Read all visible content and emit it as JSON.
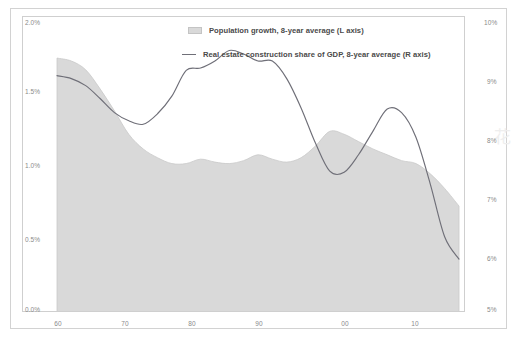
{
  "chart_data": {
    "type": "area",
    "title": "",
    "subtitle": "",
    "xlabel": "",
    "ylabel": "",
    "grid": false,
    "legend_position": "top-center",
    "x_ticks": [
      "60",
      "70",
      "80",
      "90",
      "00",
      "10"
    ],
    "x_tick_years": [
      1960,
      1970,
      1980,
      1990,
      2000,
      2010
    ],
    "xlim": [
      1960,
      2016
    ],
    "left_axis": {
      "label": "Population growth, 8-year average",
      "ticks": [
        "0.0%",
        "0.5%",
        "1.0%",
        "1.5%",
        "2.0%"
      ],
      "ylim": [
        0.0,
        2.0
      ],
      "unit": "%"
    },
    "right_axis": {
      "label": "Real estate construction share of GDP, 8-year average",
      "ticks": [
        "5%",
        "6%",
        "7%",
        "8%",
        "9%",
        "10%"
      ],
      "ylim": [
        5,
        10
      ],
      "unit": "%"
    },
    "series": [
      {
        "name": "Population growth, 8-year average (L axis)",
        "type": "area",
        "axis": "left",
        "color": "#d9d9d9",
        "x": [
          1960,
          1962,
          1964,
          1966,
          1968,
          1970,
          1972,
          1974,
          1976,
          1978,
          1980,
          1982,
          1984,
          1986,
          1988,
          1990,
          1992,
          1994,
          1996,
          1998,
          2000,
          2002,
          2004,
          2006,
          2008,
          2010,
          2012,
          2014,
          2016
        ],
        "values": [
          1.74,
          1.72,
          1.66,
          1.53,
          1.38,
          1.22,
          1.12,
          1.06,
          1.02,
          1.02,
          1.05,
          1.03,
          1.02,
          1.04,
          1.08,
          1.05,
          1.03,
          1.06,
          1.14,
          1.24,
          1.22,
          1.17,
          1.12,
          1.08,
          1.04,
          1.02,
          0.95,
          0.85,
          0.73
        ]
      },
      {
        "name": "Real estate construction share of GDP, 8-year average (R axis)",
        "type": "line",
        "axis": "right",
        "color": "#6f6f78",
        "x": [
          1960,
          1962,
          1964,
          1966,
          1968,
          1970,
          1972,
          1974,
          1976,
          1978,
          1980,
          1982,
          1984,
          1986,
          1988,
          1990,
          1992,
          1994,
          1996,
          1998,
          2000,
          2002,
          2004,
          2006,
          2008,
          2010,
          2012,
          2014,
          2016
        ],
        "values": [
          9.05,
          9.0,
          8.88,
          8.66,
          8.42,
          8.28,
          8.22,
          8.4,
          8.7,
          9.14,
          9.18,
          9.3,
          9.48,
          9.42,
          9.3,
          9.3,
          9.0,
          8.5,
          7.9,
          7.42,
          7.4,
          7.7,
          8.1,
          8.48,
          8.42,
          8.0,
          7.2,
          6.3,
          5.92
        ]
      }
    ]
  },
  "legend": [
    {
      "marker": "area-swatch",
      "label": "Population growth, 8-year average (L axis)"
    },
    {
      "marker": "line-swatch",
      "label": "Real estate construction share of GDP, 8-year average (R axis)"
    }
  ],
  "axes": {
    "left_ticks": [
      {
        "value": 2.0,
        "label": "2.0%"
      },
      {
        "value": 1.5,
        "label": "1.5%"
      },
      {
        "value": 1.0,
        "label": "1.0%"
      },
      {
        "value": 0.5,
        "label": "0.5%"
      },
      {
        "value": 0.0,
        "label": "0.0%"
      }
    ],
    "right_ticks": [
      {
        "value": 10,
        "label": "10%"
      },
      {
        "value": 9,
        "label": "9%"
      },
      {
        "value": 8,
        "label": "8%"
      },
      {
        "value": 7,
        "label": "7%"
      },
      {
        "value": 6,
        "label": "6%"
      },
      {
        "value": 5,
        "label": "5%"
      }
    ],
    "x_ticks": [
      {
        "value": 1960,
        "label": "60"
      },
      {
        "value": 1970,
        "label": "70"
      },
      {
        "value": 1980,
        "label": "80"
      },
      {
        "value": 1990,
        "label": "90"
      },
      {
        "value": 2000,
        "label": "00"
      },
      {
        "value": 2010,
        "label": "10"
      }
    ]
  },
  "colors": {
    "area_fill": "#d9d9d9",
    "area_edge": "#c9c9c9",
    "line": "#6f6f78",
    "frame": "#cfcfcf",
    "outer_frame": "#d2d2d2",
    "tick_text": "#8a8a8a",
    "legend_text": "#4a4a4a",
    "background": "#ffffff"
  }
}
